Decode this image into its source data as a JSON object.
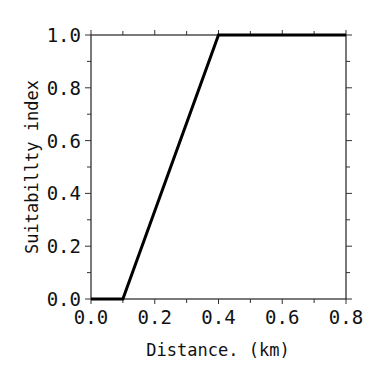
{
  "chart_data": {
    "type": "line",
    "title": "",
    "xlabel": "Distance. (km)",
    "ylabel": "Suitabillty index",
    "xlim": [
      0.0,
      0.8
    ],
    "ylim": [
      0.0,
      1.0
    ],
    "x_ticks": [
      0.0,
      0.2,
      0.4,
      0.6,
      0.8
    ],
    "x_tick_labels": [
      "0.0",
      "0.2",
      "0.4",
      "0.6",
      "0.8"
    ],
    "x_minor_step": 0.1,
    "y_ticks": [
      0.0,
      0.2,
      0.4,
      0.6,
      0.8,
      1.0
    ],
    "y_tick_labels": [
      "0.0",
      "0.2",
      "0.4",
      "0.6",
      "0.8",
      "1.0"
    ],
    "y_minor_step": 0.1,
    "grid": false,
    "legend": null,
    "series": [
      {
        "name": "Suitability index",
        "color": "#000000",
        "x": [
          0.0,
          0.1,
          0.4,
          0.8
        ],
        "y": [
          0.0,
          0.0,
          1.0,
          1.0
        ]
      }
    ]
  }
}
